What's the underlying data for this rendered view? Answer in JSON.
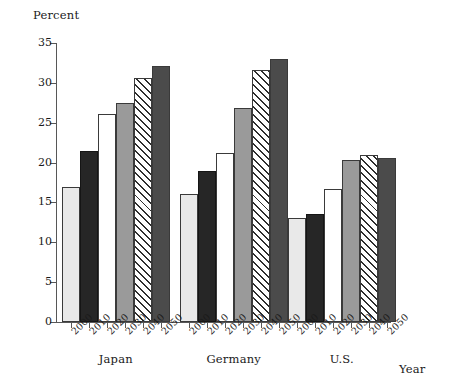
{
  "chart_data": {
    "type": "bar",
    "title": "",
    "subtitle": "",
    "ylabel": "Percent",
    "xlabel": "Year",
    "ylim": [
      0,
      35
    ],
    "yticks": [
      0,
      5,
      10,
      15,
      20,
      25,
      30,
      35
    ],
    "grid": false,
    "legend": "none",
    "categories": [
      "Japan",
      "Germany",
      "U.S."
    ],
    "x": [
      "2000",
      "2010",
      "2020",
      "2030",
      "2040",
      "2050"
    ],
    "series": [
      {
        "name": "2000",
        "values": [
          16.9,
          16.0,
          13.0
        ],
        "style": "light-gray"
      },
      {
        "name": "2010",
        "values": [
          21.4,
          19.0,
          13.5
        ],
        "style": "black"
      },
      {
        "name": "2020",
        "values": [
          26.1,
          21.2,
          16.7
        ],
        "style": "white"
      },
      {
        "name": "2030",
        "values": [
          27.5,
          26.9,
          20.3
        ],
        "style": "mid-gray"
      },
      {
        "name": "2040",
        "values": [
          30.6,
          31.6,
          21.0
        ],
        "style": "hatched"
      },
      {
        "name": "2050",
        "values": [
          32.1,
          33.0,
          20.6
        ],
        "style": "dark-gray"
      }
    ],
    "groups": [
      {
        "label": "Japan",
        "bars": [
          {
            "year": "2000",
            "value": 16.9,
            "style": "light-gray"
          },
          {
            "year": "2010",
            "value": 21.4,
            "style": "black"
          },
          {
            "year": "2020",
            "value": 26.1,
            "style": "white"
          },
          {
            "year": "2030",
            "value": 27.5,
            "style": "mid-gray"
          },
          {
            "year": "2040",
            "value": 30.6,
            "style": "hatched"
          },
          {
            "year": "2050",
            "value": 32.1,
            "style": "dark-gray"
          }
        ]
      },
      {
        "label": "Germany",
        "bars": [
          {
            "year": "2000",
            "value": 16.0,
            "style": "light-gray"
          },
          {
            "year": "2010",
            "value": 19.0,
            "style": "black"
          },
          {
            "year": "2020",
            "value": 21.2,
            "style": "white"
          },
          {
            "year": "2030",
            "value": 26.9,
            "style": "mid-gray"
          },
          {
            "year": "2040",
            "value": 31.6,
            "style": "hatched"
          },
          {
            "year": "2050",
            "value": 33.0,
            "style": "dark-gray"
          }
        ]
      },
      {
        "label": "U.S.",
        "bars": [
          {
            "year": "2000",
            "value": 13.0,
            "style": "light-gray"
          },
          {
            "year": "2010",
            "value": 13.5,
            "style": "black"
          },
          {
            "year": "2020",
            "value": 16.7,
            "style": "white"
          },
          {
            "year": "2030",
            "value": 20.3,
            "style": "mid-gray"
          },
          {
            "year": "2040",
            "value": 21.0,
            "style": "hatched"
          },
          {
            "year": "2050",
            "value": 20.6,
            "style": "dark-gray"
          }
        ]
      }
    ],
    "colors": {
      "light-gray": "#e9e9e9",
      "black": "#262626",
      "white": "#ffffff",
      "mid-gray": "#9a9a9a",
      "hatched": "#ffffff",
      "dark-gray": "#4b4b4b",
      "axis": "#575757",
      "bar_outline": "#3a3a3a",
      "text": "#1a1a1a"
    }
  }
}
